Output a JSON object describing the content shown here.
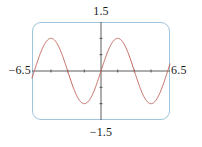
{
  "chart_data": {
    "type": "line",
    "title": "",
    "subtitle": "",
    "xlabel": "",
    "ylabel": "",
    "xlim": [
      -6.5,
      6.5
    ],
    "ylim": [
      -1.5,
      1.5
    ],
    "grid": false,
    "legend": "none",
    "window_labels": {
      "xmin": "−6.5",
      "xmax": "6.5",
      "ymax": "1.5",
      "ymin": "−1.5"
    },
    "axes": {
      "x_axis_y_value": 0,
      "y_axis_x_value": 0,
      "x_tick_values": [
        -4.71238898,
        -3.14159265,
        -1.57079633,
        1.57079633,
        3.14159265,
        4.71238898
      ],
      "y_tick_values": [
        -1.0,
        -0.5,
        0.5,
        1.0
      ],
      "tick_length_px": 3
    },
    "series": [
      {
        "name": "y = sin(x)",
        "function": "sin",
        "amplitude": 1.0,
        "period": 6.283185307,
        "phase": 0.0,
        "vertical_shift": 0.0,
        "samples": 401,
        "color": "#c2665d",
        "line_width": 1.0
      }
    ],
    "key_points": {
      "zeros": [
        -6.28318531,
        -3.14159265,
        0,
        3.14159265,
        6.28318531
      ],
      "maxima_x": [
        -4.71238898,
        1.57079633
      ],
      "maxima_y": 1.0,
      "minima_x": [
        -1.57079633,
        4.71238898
      ],
      "minima_y": -1.0
    }
  },
  "figure": {
    "frame": {
      "border_color": "#9fc4dd",
      "corner_radius_px": 9,
      "fill": "none"
    },
    "axis_color": "#4a4a4a",
    "curve_color": "#c2665d",
    "background": "#ffffff"
  }
}
